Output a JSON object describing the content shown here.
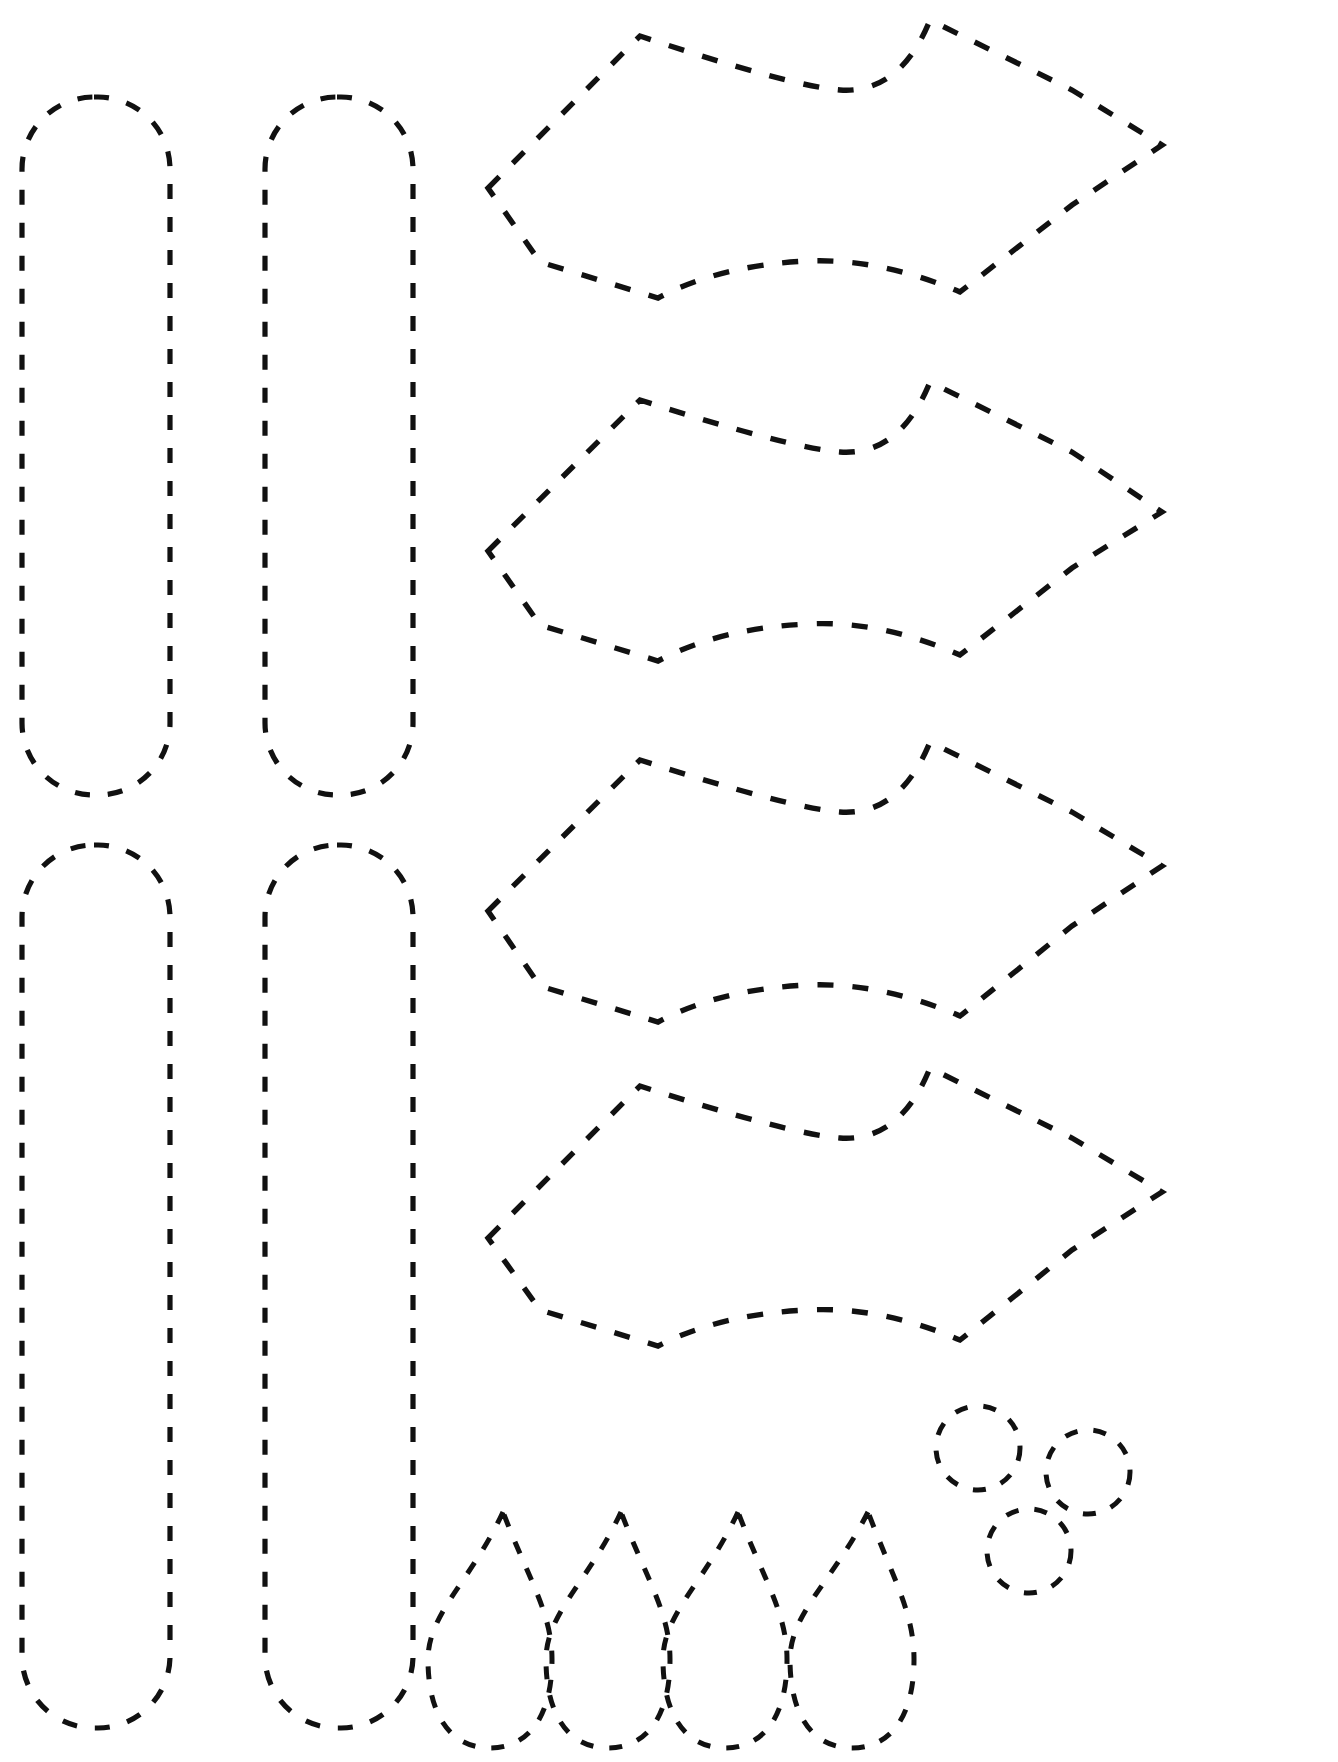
{
  "document": {
    "title": "Cut-Out Pattern Template Sheet",
    "kind": "printable-craft-pattern",
    "background_color": "#ffffff",
    "stroke_color": "#111111",
    "width": 1338,
    "height": 1762,
    "line_style": "dashed-cut-line",
    "text_content": "",
    "labels": []
  },
  "groups": [
    {
      "id": "strips",
      "name": "rounded-strip-group",
      "count": 4,
      "description": "Tall rounded-end rectangular strips arranged in two columns and two rows"
    },
    {
      "id": "leaves",
      "name": "pointed-lens-group",
      "count": 4,
      "description": "Elongated six-point lens / leaf shapes stacked vertically"
    },
    {
      "id": "teardrops",
      "name": "teardrop-group",
      "count": 4,
      "description": "Teardrop petals with pointed top and rounded base in a row"
    },
    {
      "id": "circles",
      "name": "circle-group",
      "count": 3,
      "description": "Small circles clustered in a triangular arrangement"
    }
  ],
  "shapes": {
    "strips": [
      {
        "name": "strip-top-left",
        "x": 22,
        "y": 97,
        "w": 148,
        "h": 698,
        "radius": 72
      },
      {
        "name": "strip-top-right",
        "x": 265,
        "y": 97,
        "w": 148,
        "h": 698,
        "radius": 72
      },
      {
        "name": "strip-bottom-left",
        "x": 22,
        "y": 845,
        "w": 148,
        "h": 883,
        "radius": 72
      },
      {
        "name": "strip-bottom-right",
        "x": 265,
        "y": 845,
        "w": 148,
        "h": 883,
        "radius": 72
      }
    ],
    "leaves": [
      {
        "name": "lens-1",
        "path": "M 488 188 L 640 36 Q 790 86 840 90 Q 900 94 930 20 L 1072 90 L 1162 145 L 1072 205 L 960 292 Q 880 258 808 261 Q 720 265 658 298 L 540 262 Z"
      },
      {
        "name": "lens-2",
        "path": "M 488 551 L 640 400 Q 790 448 840 452 Q 900 456 930 382 L 1072 452 L 1162 512 L 1072 568 L 960 655 Q 880 620 808 624 Q 720 628 658 661 L 540 625 Z"
      },
      {
        "name": "lens-3",
        "path": "M 488 911 L 640 760 Q 790 808 840 812 Q 900 816 930 742 L 1072 812 L 1162 866 L 1072 926 L 960 1016 Q 880 982 808 985 Q 720 989 658 1022 L 540 986 Z"
      },
      {
        "name": "lens-4",
        "path": "M 488 1238 L 640 1086 Q 790 1134 840 1138 Q 900 1142 930 1068 L 1072 1138 L 1162 1192 L 1072 1250 L 960 1340 Q 880 1306 808 1310 Q 720 1314 658 1346 L 540 1310 Z"
      }
    ],
    "teardrops": [
      {
        "name": "teardrop-1",
        "tip_x": 503,
        "tip_y": 1512,
        "cx": 490,
        "cy": 1640,
        "rx": 62,
        "ry": 108
      },
      {
        "name": "teardrop-2",
        "tip_x": 621,
        "tip_y": 1512,
        "cx": 608,
        "cy": 1640,
        "rx": 62,
        "ry": 108
      },
      {
        "name": "teardrop-3",
        "tip_x": 738,
        "tip_y": 1512,
        "cx": 725,
        "cy": 1640,
        "rx": 62,
        "ry": 108
      },
      {
        "name": "teardrop-4",
        "tip_x": 868,
        "tip_y": 1512,
        "cx": 852,
        "cy": 1640,
        "rx": 62,
        "ry": 108
      }
    ],
    "circles": [
      {
        "name": "circle-upper-left",
        "cx": 978,
        "cy": 1448,
        "r": 42
      },
      {
        "name": "circle-upper-right",
        "cx": 1088,
        "cy": 1472,
        "r": 42
      },
      {
        "name": "circle-lower",
        "cx": 1029,
        "cy": 1551,
        "r": 42
      }
    ]
  }
}
